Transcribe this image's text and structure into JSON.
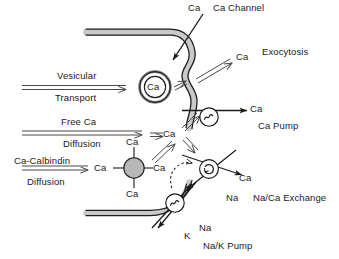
{
  "diagram": {
    "colors": {
      "membrane_fill": "#c9c9c9",
      "membrane_stroke": "#1a1a1a",
      "calbindin_fill": "#b8b8b8",
      "line": "#1a1a1a",
      "background": "#ffffff",
      "text": "#1a1a1a"
    },
    "labels": {
      "ca_entry": "Ca",
      "ca_channel": "Ca Channel",
      "vesicular": "Vesicular",
      "transport": "Transport",
      "vesicle_ca": "Ca",
      "exocytosis_ca": "Ca",
      "exocytosis": "Exocytosis",
      "free_ca": "Free Ca",
      "diffusion_free": "Diffusion",
      "ca_cytosol": "Ca",
      "ca_pump_ion": "Ca",
      "ca_pump": "Ca Pump",
      "ca_calbindin": "Ca-Calbindin",
      "diffusion_calbindin": "Diffusion",
      "calbindin_ca_left": "Ca",
      "calbindin_ca_top": "Ca",
      "calbindin_ca_right": "Ca",
      "calbindin_ca_bottom": "Ca",
      "exchange_ca": "Ca",
      "exchange_na": "Na",
      "na_ca_exchange": "Na/Ca Exchange",
      "pump_k": "K",
      "pump_na": "Na",
      "na_k_pump": "Na/K Pump"
    },
    "components": [
      {
        "name": "ca-channel",
        "kind": "membrane-invagination"
      },
      {
        "name": "transport-vesicle",
        "kind": "double-ring-vesicle",
        "contains": "Ca"
      },
      {
        "name": "calbindin-complex",
        "kind": "shaded-circle",
        "bound_ions": 4
      },
      {
        "name": "ca-pump",
        "kind": "circle-sine",
        "glyph": "sine-wave-icon"
      },
      {
        "name": "na-ca-exchanger",
        "kind": "circle-rotation",
        "glyph": "circular-arrow-icon"
      },
      {
        "name": "na-k-pump",
        "kind": "circle-sine",
        "glyph": "sine-wave-icon"
      }
    ]
  }
}
